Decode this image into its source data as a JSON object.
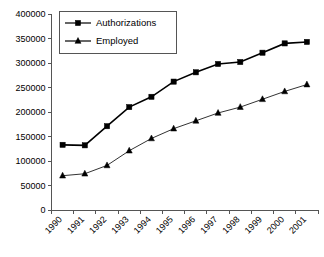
{
  "chart_data": {
    "type": "line",
    "title": "",
    "xlabel": "",
    "ylabel": "",
    "categories": [
      "1990",
      "1991",
      "1992",
      "1993",
      "1994",
      "1995",
      "1996",
      "1997",
      "1998",
      "1999",
      "2000",
      "2001"
    ],
    "series": [
      {
        "name": "Authorizations",
        "marker": "square",
        "values": [
          133000,
          132000,
          171000,
          210000,
          231000,
          262000,
          281000,
          298000,
          302000,
          321000,
          340000,
          343000
        ]
      },
      {
        "name": "Employed",
        "marker": "triangle",
        "values": [
          70000,
          74000,
          91000,
          121000,
          146000,
          166000,
          182000,
          198000,
          210000,
          226000,
          242000,
          256000
        ]
      }
    ],
    "ylim": [
      0,
      400000
    ],
    "ytick_values": [
      0,
      50000,
      100000,
      150000,
      200000,
      250000,
      300000,
      350000,
      400000
    ],
    "ytick_labels": [
      "0",
      "50000",
      "100000",
      "150000",
      "200000",
      "250000",
      "300000",
      "350000",
      "400000"
    ],
    "grid": false,
    "legend_position": "top-left",
    "legend_entries": [
      "Authorizations",
      "Employed"
    ],
    "xtick_rotation_degrees": 45
  }
}
